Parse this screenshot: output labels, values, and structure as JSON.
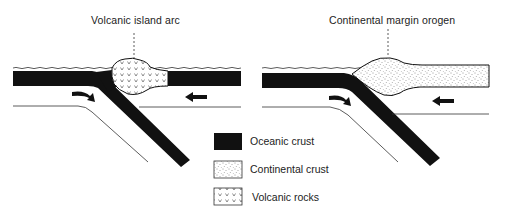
{
  "diagram": {
    "panels": [
      {
        "title": "Volcanic island arc",
        "type": "ocean-ocean subduction"
      },
      {
        "title": "Continental margin orogen",
        "type": "ocean-continent subduction"
      }
    ],
    "legend": {
      "items": [
        {
          "label": "Oceanic crust",
          "pattern": "solid-black"
        },
        {
          "label": "Continental crust",
          "pattern": "stipple"
        },
        {
          "label": "Volcanic rocks",
          "pattern": "v-marks"
        }
      ]
    },
    "colors": {
      "oceanic": "#111111",
      "line": "#222222",
      "background": "#ffffff"
    }
  }
}
